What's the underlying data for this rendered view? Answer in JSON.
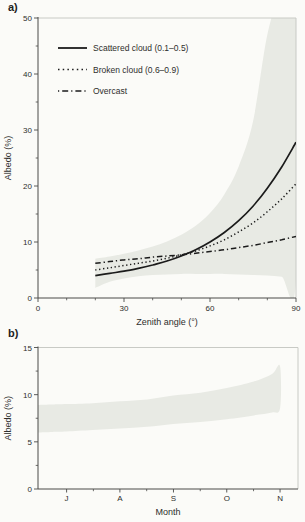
{
  "figure": {
    "panel_a_label": "a)",
    "panel_b_label": "b)",
    "colors": {
      "line": "#1b1b1b",
      "band": "#e8eae4",
      "axis": "#4a4a48",
      "spine_light": "#c8cac5",
      "text": "#2e2e2c",
      "background": "#fbfbf8"
    }
  },
  "chart_data": [
    {
      "id": "panel-a",
      "type": "line",
      "title": "",
      "xlabel": "Zenith angle (°)",
      "ylabel": "Albedo (%)",
      "xlim": [
        0,
        90
      ],
      "ylim": [
        0,
        50
      ],
      "grid": false,
      "legend_position": "upper-left",
      "x_ticks_major": [
        0,
        30,
        60,
        90
      ],
      "x_ticks_minor": [
        10,
        20,
        40,
        50,
        70,
        80
      ],
      "y_ticks_major": [
        0,
        10,
        20,
        30,
        40,
        50
      ],
      "y_ticks_minor": [
        5,
        15,
        25,
        35,
        45
      ],
      "x": [
        20,
        25,
        30,
        35,
        40,
        45,
        50,
        55,
        60,
        65,
        70,
        75,
        80,
        85,
        90
      ],
      "series": [
        {
          "name": "Scattered cloud (0.1–0.5)",
          "style": "solid",
          "values": [
            4.0,
            4.4,
            4.8,
            5.3,
            5.9,
            6.6,
            7.5,
            8.6,
            10.0,
            11.7,
            13.8,
            16.4,
            19.6,
            23.4,
            27.8
          ]
        },
        {
          "name": "Broken cloud (0.6–0.9)",
          "style": "dotted",
          "values": [
            5.0,
            5.4,
            5.8,
            6.2,
            6.6,
            7.1,
            7.7,
            8.4,
            9.3,
            10.4,
            11.8,
            13.4,
            15.4,
            17.7,
            20.4
          ]
        },
        {
          "name": "Overcast",
          "style": "dashdot",
          "values": [
            6.2,
            6.5,
            6.8,
            7.0,
            7.3,
            7.5,
            7.7,
            8.0,
            8.3,
            8.6,
            9.0,
            9.4,
            9.9,
            10.4,
            11.0
          ]
        }
      ],
      "uncertainty_band": {
        "upper": [
          7.0,
          7.4,
          7.9,
          8.5,
          9.2,
          10.1,
          11.3,
          12.9,
          15.2,
          18.5,
          23.5,
          31.5,
          47.0,
          55.0,
          56.0
        ],
        "lower": [
          1.8,
          2.9,
          3.5,
          3.9,
          4.1,
          4.2,
          4.3,
          4.3,
          4.3,
          4.3,
          4.2,
          4.1,
          4.0,
          3.8,
          3.4
        ]
      }
    },
    {
      "id": "panel-b",
      "type": "area",
      "title": "",
      "xlabel": "Month",
      "ylabel": "Albedo (%)",
      "ylim": [
        0,
        15
      ],
      "grid": false,
      "y_ticks_major": [
        0,
        5,
        10,
        15
      ],
      "y_ticks_minor": [
        2.5,
        7.5,
        12.5
      ],
      "x_tick_labels": [
        "J",
        "A",
        "S",
        "O",
        "N"
      ],
      "band": {
        "x_frac": [
          0,
          0.055,
          0.11,
          0.21,
          0.315,
          0.42,
          0.52,
          0.625,
          0.726,
          0.83,
          0.9,
          0.931
        ],
        "upper": [
          8.9,
          8.95,
          9.0,
          9.1,
          9.3,
          9.5,
          9.9,
          10.2,
          10.7,
          11.4,
          12.2,
          13.0
        ],
        "lower": [
          6.0,
          6.05,
          6.1,
          6.25,
          6.4,
          6.6,
          6.9,
          7.1,
          7.4,
          7.8,
          8.1,
          8.6
        ]
      }
    }
  ]
}
